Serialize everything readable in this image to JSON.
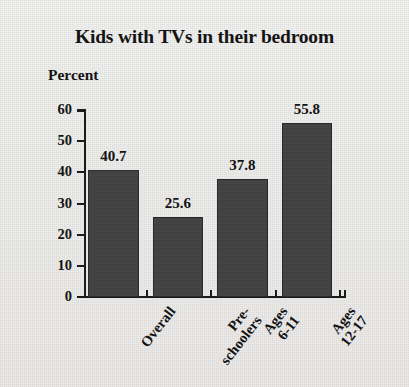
{
  "chart_data": {
    "type": "bar",
    "title": "Kids with TVs in their bedroom",
    "subtitle": "Percent",
    "ylabel": "Percent",
    "xlabel": "",
    "categories": [
      "Overall",
      "Pre-schoolers",
      "Ages 6-11",
      "Ages 12-17"
    ],
    "category_lines": [
      [
        "Overall"
      ],
      [
        "Pre-",
        "schoolers"
      ],
      [
        "Ages",
        "6-11"
      ],
      [
        "Ages",
        "12-17"
      ]
    ],
    "values": [
      40.7,
      25.6,
      37.8,
      55.8
    ],
    "value_labels": [
      "40.7",
      "25.6",
      "37.8",
      "55.8"
    ],
    "ylim": [
      0,
      60
    ],
    "yticks": [
      0,
      10,
      20,
      30,
      40,
      50,
      60
    ],
    "ytick_labels": [
      "0",
      "10",
      "20",
      "30",
      "40",
      "50",
      "60"
    ],
    "grid": false,
    "legend": null,
    "bar_color": "#3f3f3f",
    "axis_color": "#1b1b1b",
    "background_color": "#efefee",
    "text_color": "#141414"
  }
}
